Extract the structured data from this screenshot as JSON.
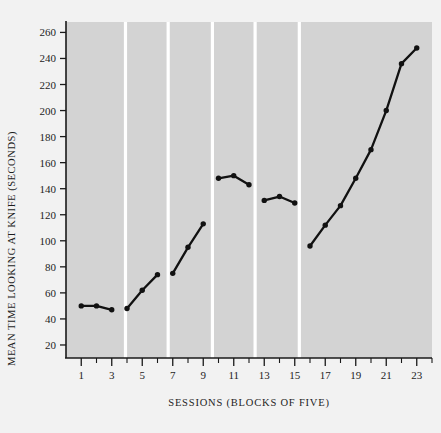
{
  "chart_data": {
    "type": "line",
    "title": "",
    "xlabel": "SESSIONS (BLOCKS OF FIVE)",
    "ylabel": "MEAN TIME LOOKING AT KNIFE (SECONDS)",
    "xlim": [
      0,
      24
    ],
    "ylim": [
      10,
      268
    ],
    "grid": false,
    "legend": "none",
    "ytick_labels": [
      "260",
      "240",
      "220",
      "200",
      "180",
      "160",
      "140",
      "120",
      "100",
      "80",
      "60",
      "40",
      "20"
    ],
    "ytick_values": [
      260,
      240,
      220,
      200,
      180,
      160,
      140,
      120,
      100,
      80,
      60,
      40,
      20
    ],
    "xtick_labels": [
      "1",
      "3",
      "5",
      "7",
      "9",
      "11",
      "13",
      "15",
      "17",
      "19",
      "21",
      "23"
    ],
    "xtick_values": [
      1,
      3,
      5,
      7,
      9,
      11,
      13,
      15,
      17,
      19,
      21,
      23
    ],
    "xtick_minor_values": [
      2,
      4,
      6,
      8,
      10,
      12,
      14,
      16,
      18,
      20,
      22,
      24
    ],
    "marker": "filled-circle",
    "line_color": "#111111",
    "plot_background": "#d3d3d3",
    "page_background": "#f2f2f2",
    "segments": [
      {
        "phase": "Praise",
        "x": [
          1,
          2,
          3
        ],
        "y": [
          50,
          50,
          47
        ]
      },
      {
        "phase": "Feedback & Praise",
        "x": [
          4,
          5,
          6
        ],
        "y": [
          48,
          62,
          74
        ]
      },
      {
        "phase": "Praise",
        "x": [
          7,
          8,
          9
        ],
        "y": [
          75,
          95,
          113
        ]
      },
      {
        "phase": "No Feedback No Praise",
        "x": [
          10,
          11,
          12
        ],
        "y": [
          148,
          150,
          143
        ]
      },
      {
        "phase": "Praise",
        "x": [
          13,
          14,
          15
        ],
        "y": [
          131,
          134,
          129
        ]
      },
      {
        "phase": "Feedback & Praise",
        "x": [
          16,
          17,
          18,
          19,
          20,
          21,
          22,
          23
        ],
        "y": [
          96,
          112,
          127,
          148,
          170,
          200,
          236,
          248
        ]
      }
    ],
    "phases": [
      {
        "label_lines": [
          "Praise"
        ],
        "x_start": 0.3,
        "x_end": 3.9
      },
      {
        "label_lines": [
          "Feedback",
          "& Praise"
        ],
        "x_start": 3.9,
        "x_end": 6.7
      },
      {
        "label_lines": [
          "Praise"
        ],
        "x_start": 6.7,
        "x_end": 9.6
      },
      {
        "label_lines": [
          "No",
          "Feedback",
          "No",
          "Praise"
        ],
        "x_start": 9.6,
        "x_end": 12.4
      },
      {
        "label_lines": [
          "Praise"
        ],
        "x_start": 12.4,
        "x_end": 15.3
      },
      {
        "label_lines": [
          "Feedback & Praise"
        ],
        "x_start": 15.3,
        "x_end": 24.0
      }
    ]
  }
}
